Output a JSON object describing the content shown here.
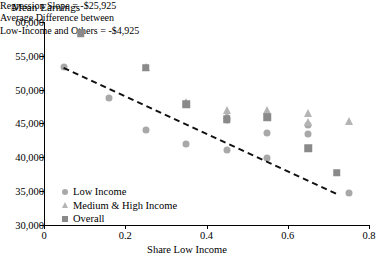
{
  "chart_data": {
    "type": "scatter",
    "title": "Mean Earnings",
    "xlabel": "Share Low Income",
    "ylabel": "Mean Earnings",
    "xlim": [
      0,
      0.8
    ],
    "ylim": [
      30000,
      60000
    ],
    "xticks": [
      0,
      0.2,
      0.4,
      0.6,
      0.8
    ],
    "xtick_labels": [
      "0",
      "0.2",
      "0.4",
      "0.6",
      "0.8"
    ],
    "yticks": [
      30000,
      35000,
      40000,
      45000,
      50000,
      55000,
      60000
    ],
    "ytick_labels": [
      "30,000",
      "35,000",
      "40,000",
      "45,000",
      "50,000",
      "55,000",
      "60,000"
    ],
    "grid": false,
    "legend_position": "lower-left",
    "series": [
      {
        "name": "Low Income",
        "marker": "circle",
        "color": "#a8a8a8",
        "points": [
          {
            "x": 0.05,
            "y": 53400
          },
          {
            "x": 0.16,
            "y": 48700
          },
          {
            "x": 0.25,
            "y": 44000
          },
          {
            "x": 0.35,
            "y": 42000
          },
          {
            "x": 0.45,
            "y": 45500
          },
          {
            "x": 0.45,
            "y": 41100
          },
          {
            "x": 0.55,
            "y": 43500
          },
          {
            "x": 0.55,
            "y": 39900
          },
          {
            "x": 0.65,
            "y": 44700
          },
          {
            "x": 0.65,
            "y": 43400
          },
          {
            "x": 0.75,
            "y": 34600
          }
        ]
      },
      {
        "name": "Medium & High Income",
        "marker": "triangle",
        "color": "#b4b4b4",
        "points": [
          {
            "x": 0.25,
            "y": 53300
          },
          {
            "x": 0.35,
            "y": 48200
          },
          {
            "x": 0.45,
            "y": 47000
          },
          {
            "x": 0.45,
            "y": 46200
          },
          {
            "x": 0.55,
            "y": 47000
          },
          {
            "x": 0.65,
            "y": 46500
          },
          {
            "x": 0.65,
            "y": 45200
          },
          {
            "x": 0.75,
            "y": 45300
          }
        ]
      },
      {
        "name": "Overall",
        "marker": "square",
        "color": "#8a8a8a",
        "points": [
          {
            "x": 0.09,
            "y": 58300
          },
          {
            "x": 0.25,
            "y": 53200
          },
          {
            "x": 0.35,
            "y": 47800
          },
          {
            "x": 0.45,
            "y": 45600
          },
          {
            "x": 0.55,
            "y": 45900
          },
          {
            "x": 0.65,
            "y": 41300
          },
          {
            "x": 0.72,
            "y": 37700
          }
        ]
      }
    ],
    "trend_line": {
      "style": "dashed",
      "color": "#111111",
      "x_start": 0.05,
      "y_start": 53400,
      "x_end": 0.72,
      "y_end": 34800
    },
    "annotations": [
      "Regression Slope = -$25,925",
      "Average Difference between",
      "Low-Income and Others = -$4,925"
    ]
  }
}
